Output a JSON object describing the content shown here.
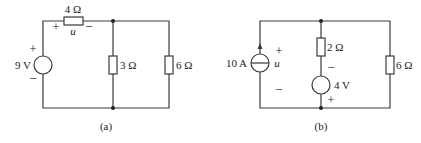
{
  "figure": {
    "circuit_a": {
      "caption": "(a)",
      "voltage_source": {
        "label": "9 V",
        "plus": "+",
        "minus": "−"
      },
      "series_resistor": {
        "label": "4 Ω",
        "voltage_label": "u",
        "plus": "+",
        "minus": "−"
      },
      "resistor_middle": {
        "label": "3 Ω"
      },
      "resistor_right": {
        "label": "6 Ω"
      }
    },
    "circuit_b": {
      "caption": "(b)",
      "current_source": {
        "label": "10 A",
        "voltage_label": "u",
        "plus": "+",
        "minus": "−"
      },
      "resistor_middle": {
        "label": "2 Ω"
      },
      "voltage_source": {
        "label": "4 V",
        "minus": "−",
        "plus": "+"
      },
      "resistor_right": {
        "label": "6 Ω"
      }
    }
  }
}
